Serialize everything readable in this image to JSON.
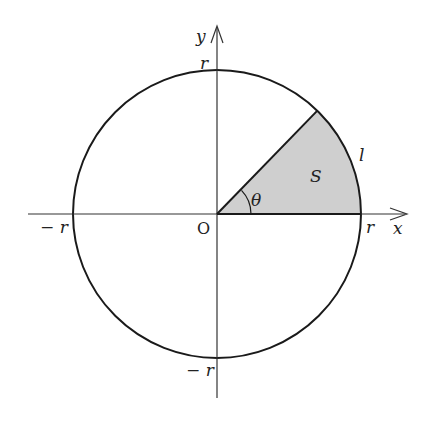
{
  "diagram": {
    "center": {
      "x": 217,
      "y": 214
    },
    "radius_px": 144,
    "angle_deg": 44,
    "colors": {
      "line": "#1a1a1a",
      "sector_fill": "#cfcfcf",
      "axis": "#333333"
    },
    "labels": {
      "y_axis": "y",
      "x_axis": "x",
      "origin": "O",
      "r_top": "r",
      "r_right": "r",
      "neg_r_left": "− r",
      "neg_r_bottom": "− r",
      "area": "S",
      "arc_length": "l",
      "angle": "θ"
    }
  }
}
